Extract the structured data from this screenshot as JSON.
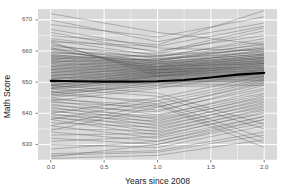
{
  "chart_data": {
    "type": "line",
    "title": "",
    "xlabel": "Years since 2008",
    "ylabel": "Math Score",
    "xlim": [
      -0.12,
      2.12
    ],
    "ylim": [
      625.0,
      673.5
    ],
    "xticks": [
      0.0,
      0.5,
      1.0,
      1.5,
      2.0
    ],
    "xticklabels": [
      "0.0",
      "0.5",
      "1.0",
      "1.5",
      "2.0"
    ],
    "yticks": [
      630,
      640,
      650,
      660,
      670
    ],
    "yticklabels": [
      "630",
      "640",
      "650",
      "660",
      "670"
    ],
    "grid": true,
    "grid_minor": true,
    "legend": "none",
    "panel_background": "#d9d9d9",
    "grid_color": "#ffffff",
    "series_color": "#4d4d4d",
    "trend_color": "#000000",
    "x": [
      0.0,
      1.0,
      2.0
    ],
    "trend_line": {
      "name": "Mean trend",
      "x": [
        0.0,
        0.25,
        0.5,
        0.75,
        1.0,
        1.25,
        1.5,
        1.75,
        2.0
      ],
      "values": [
        650.4,
        650.3,
        650.2,
        650.2,
        650.3,
        650.7,
        651.5,
        652.4,
        653.0
      ],
      "linewidth": 2.2
    },
    "series": [
      {
        "name": "s1",
        "values": [
          672.0,
          666.0,
          662.0
        ]
      },
      {
        "name": "s2",
        "values": [
          670.0,
          663.0,
          669.0
        ]
      },
      {
        "name": "s3",
        "values": [
          668.5,
          664.5,
          671.0
        ]
      },
      {
        "name": "s4",
        "values": [
          667.0,
          661.0,
          660.0
        ]
      },
      {
        "name": "s5",
        "values": [
          666.0,
          659.5,
          667.5
        ]
      },
      {
        "name": "s6",
        "values": [
          665.0,
          662.0,
          673.0
        ]
      },
      {
        "name": "s7",
        "values": [
          664.0,
          660.0,
          665.0
        ]
      },
      {
        "name": "s8",
        "values": [
          663.5,
          658.5,
          663.0
        ]
      },
      {
        "name": "s9",
        "values": [
          663.0,
          661.5,
          668.0
        ]
      },
      {
        "name": "s10",
        "values": [
          662.0,
          657.5,
          661.0
        ]
      },
      {
        "name": "s11",
        "values": [
          661.5,
          659.0,
          666.5
        ]
      },
      {
        "name": "s12",
        "values": [
          661.0,
          656.5,
          659.0
        ]
      },
      {
        "name": "s13",
        "values": [
          660.5,
          658.0,
          664.0
        ]
      },
      {
        "name": "s14",
        "values": [
          660.0,
          656.0,
          658.0
        ]
      },
      {
        "name": "s15",
        "values": [
          659.5,
          657.0,
          662.5
        ]
      },
      {
        "name": "s16",
        "values": [
          659.0,
          655.5,
          657.5
        ]
      },
      {
        "name": "s17",
        "values": [
          658.8,
          656.8,
          661.5
        ]
      },
      {
        "name": "s18",
        "values": [
          658.5,
          655.0,
          660.5
        ]
      },
      {
        "name": "s19",
        "values": [
          658.2,
          656.5,
          659.8
        ]
      },
      {
        "name": "s20",
        "values": [
          658.0,
          654.8,
          658.8
        ]
      },
      {
        "name": "s21",
        "values": [
          657.8,
          656.2,
          659.2
        ]
      },
      {
        "name": "s22",
        "values": [
          657.5,
          654.5,
          658.2
        ]
      },
      {
        "name": "s23",
        "values": [
          657.2,
          656.0,
          658.6
        ]
      },
      {
        "name": "s24",
        "values": [
          657.0,
          654.2,
          657.8
        ]
      },
      {
        "name": "s25",
        "values": [
          656.8,
          655.8,
          658.0
        ]
      },
      {
        "name": "s26",
        "values": [
          656.5,
          654.0,
          657.2
        ]
      },
      {
        "name": "s27",
        "values": [
          656.2,
          655.5,
          657.6
        ]
      },
      {
        "name": "s28",
        "values": [
          656.0,
          653.8,
          656.8
        ]
      },
      {
        "name": "s29",
        "values": [
          655.8,
          655.2,
          657.0
        ]
      },
      {
        "name": "s30",
        "values": [
          655.5,
          653.5,
          656.4
        ]
      },
      {
        "name": "s31",
        "values": [
          655.2,
          655.0,
          656.8
        ]
      },
      {
        "name": "s32",
        "values": [
          655.0,
          653.2,
          656.0
        ]
      },
      {
        "name": "s33",
        "values": [
          654.8,
          654.8,
          656.4
        ]
      },
      {
        "name": "s34",
        "values": [
          654.5,
          653.0,
          655.6
        ]
      },
      {
        "name": "s35",
        "values": [
          654.2,
          654.5,
          656.0
        ]
      },
      {
        "name": "s36",
        "values": [
          654.0,
          652.8,
          655.2
        ]
      },
      {
        "name": "s37",
        "values": [
          653.8,
          654.2,
          655.6
        ]
      },
      {
        "name": "s38",
        "values": [
          653.5,
          652.5,
          654.8
        ]
      },
      {
        "name": "s39",
        "values": [
          653.2,
          654.0,
          655.2
        ]
      },
      {
        "name": "s40",
        "values": [
          653.0,
          652.2,
          654.4
        ]
      },
      {
        "name": "s41",
        "values": [
          652.8,
          653.8,
          654.8
        ]
      },
      {
        "name": "s42",
        "values": [
          652.5,
          652.0,
          654.0
        ]
      },
      {
        "name": "s43",
        "values": [
          652.2,
          653.5,
          654.5
        ]
      },
      {
        "name": "s44",
        "values": [
          652.0,
          651.8,
          653.6
        ]
      },
      {
        "name": "s45",
        "values": [
          651.8,
          653.2,
          654.2
        ]
      },
      {
        "name": "s46",
        "values": [
          651.5,
          651.5,
          653.2
        ]
      },
      {
        "name": "s47",
        "values": [
          651.2,
          653.0,
          653.8
        ]
      },
      {
        "name": "s48",
        "values": [
          651.0,
          651.2,
          652.8
        ]
      },
      {
        "name": "s49",
        "values": [
          650.8,
          652.8,
          653.5
        ]
      },
      {
        "name": "s50",
        "values": [
          650.5,
          651.0,
          652.4
        ]
      },
      {
        "name": "s51",
        "values": [
          650.2,
          652.5,
          653.2
        ]
      },
      {
        "name": "s52",
        "values": [
          650.0,
          650.8,
          652.0
        ]
      },
      {
        "name": "s53",
        "values": [
          649.8,
          652.2,
          652.8
        ]
      },
      {
        "name": "s54",
        "values": [
          649.5,
          650.5,
          651.6
        ]
      },
      {
        "name": "s55",
        "values": [
          649.2,
          652.0,
          652.5
        ]
      },
      {
        "name": "s56",
        "values": [
          649.0,
          650.2,
          651.2
        ]
      },
      {
        "name": "s57",
        "values": [
          648.8,
          651.8,
          652.2
        ]
      },
      {
        "name": "s58",
        "values": [
          648.5,
          650.0,
          650.8
        ]
      },
      {
        "name": "s59",
        "values": [
          648.2,
          651.5,
          651.8
        ]
      },
      {
        "name": "s60",
        "values": [
          648.0,
          649.8,
          650.4
        ]
      },
      {
        "name": "s61",
        "values": [
          647.5,
          651.0,
          651.5
        ]
      },
      {
        "name": "s62",
        "values": [
          647.0,
          649.5,
          650.0
        ]
      },
      {
        "name": "s63",
        "values": [
          646.5,
          650.5,
          651.0
        ]
      },
      {
        "name": "s64",
        "values": [
          646.0,
          649.0,
          649.5
        ]
      },
      {
        "name": "s65",
        "values": [
          645.5,
          650.0,
          650.5
        ]
      },
      {
        "name": "s66",
        "values": [
          645.0,
          648.5,
          649.0
        ]
      },
      {
        "name": "s67",
        "values": [
          656.5,
          657.5,
          659.5
        ]
      },
      {
        "name": "s68",
        "values": [
          657.5,
          658.5,
          660.5
        ]
      },
      {
        "name": "s69",
        "values": [
          658.5,
          657.0,
          661.0
        ]
      },
      {
        "name": "s70",
        "values": [
          659.5,
          658.2,
          662.0
        ]
      },
      {
        "name": "s71",
        "values": [
          655.0,
          657.2,
          660.0
        ]
      },
      {
        "name": "s72",
        "values": [
          654.0,
          656.5,
          659.0
        ]
      },
      {
        "name": "s73",
        "values": [
          653.0,
          655.8,
          658.5
        ]
      },
      {
        "name": "s74",
        "values": [
          652.0,
          655.0,
          657.5
        ]
      },
      {
        "name": "s75",
        "values": [
          651.0,
          654.2,
          657.0
        ]
      },
      {
        "name": "s76",
        "values": [
          650.0,
          653.5,
          656.5
        ]
      },
      {
        "name": "s77",
        "values": [
          649.0,
          652.8,
          656.0
        ]
      },
      {
        "name": "s78",
        "values": [
          648.0,
          652.0,
          655.5
        ]
      },
      {
        "name": "s79",
        "values": [
          660.5,
          655.0,
          656.0
        ]
      },
      {
        "name": "s80",
        "values": [
          661.0,
          654.0,
          655.0
        ]
      },
      {
        "name": "s81",
        "values": [
          662.5,
          653.0,
          654.5
        ]
      },
      {
        "name": "s82",
        "values": [
          663.0,
          652.0,
          654.0
        ]
      },
      {
        "name": "s83",
        "values": [
          645.0,
          641.0,
          648.0
        ]
      },
      {
        "name": "s84",
        "values": [
          644.0,
          639.5,
          646.5
        ]
      },
      {
        "name": "s85",
        "values": [
          643.5,
          642.0,
          650.0
        ]
      },
      {
        "name": "s86",
        "values": [
          643.0,
          638.0,
          645.0
        ]
      },
      {
        "name": "s87",
        "values": [
          642.5,
          640.5,
          649.0
        ]
      },
      {
        "name": "s88",
        "values": [
          642.0,
          637.0,
          644.0
        ]
      },
      {
        "name": "s89",
        "values": [
          641.5,
          639.0,
          647.5
        ]
      },
      {
        "name": "s90",
        "values": [
          641.0,
          636.0,
          643.0
        ]
      },
      {
        "name": "s91",
        "values": [
          640.5,
          638.5,
          646.0
        ]
      },
      {
        "name": "s92",
        "values": [
          640.0,
          635.0,
          642.0
        ]
      },
      {
        "name": "s93",
        "values": [
          639.5,
          637.5,
          645.5
        ]
      },
      {
        "name": "s94",
        "values": [
          639.0,
          634.0,
          641.0
        ]
      },
      {
        "name": "s95",
        "values": [
          638.5,
          636.5,
          644.5
        ]
      },
      {
        "name": "s96",
        "values": [
          638.0,
          633.0,
          640.0
        ]
      },
      {
        "name": "s97",
        "values": [
          637.0,
          635.5,
          643.5
        ]
      },
      {
        "name": "s98",
        "values": [
          636.0,
          632.0,
          639.0
        ]
      },
      {
        "name": "s99",
        "values": [
          635.0,
          634.5,
          642.5
        ]
      },
      {
        "name": "s100",
        "values": [
          634.0,
          631.0,
          638.0
        ]
      },
      {
        "name": "s101",
        "values": [
          633.0,
          633.5,
          641.5
        ]
      },
      {
        "name": "s102",
        "values": [
          632.0,
          630.0,
          637.0
        ]
      },
      {
        "name": "s103",
        "values": [
          631.0,
          632.5,
          640.5
        ]
      },
      {
        "name": "s104",
        "values": [
          630.0,
          629.0,
          636.0
        ]
      },
      {
        "name": "s105",
        "values": [
          628.5,
          631.0,
          639.0
        ]
      },
      {
        "name": "s106",
        "values": [
          627.0,
          628.0,
          634.0
        ]
      },
      {
        "name": "s107",
        "values": [
          626.0,
          630.0,
          638.0
        ]
      },
      {
        "name": "s108",
        "values": [
          646.0,
          644.0,
          632.0
        ]
      },
      {
        "name": "s109",
        "values": [
          647.0,
          643.0,
          630.5
        ]
      },
      {
        "name": "s110",
        "values": [
          644.5,
          642.5,
          629.0
        ]
      },
      {
        "name": "s111",
        "values": [
          648.0,
          645.5,
          635.0
        ]
      },
      {
        "name": "s112",
        "values": [
          649.0,
          646.5,
          636.5
        ]
      },
      {
        "name": "s113",
        "values": [
          626.5,
          627.5,
          633.0
        ]
      },
      {
        "name": "s114",
        "values": [
          625.5,
          626.5,
          631.5
        ]
      },
      {
        "name": "s115",
        "values": [
          640.0,
          645.0,
          652.0
        ]
      },
      {
        "name": "s116",
        "values": [
          638.0,
          644.0,
          651.0
        ]
      },
      {
        "name": "s117",
        "values": [
          636.0,
          643.0,
          650.5
        ]
      },
      {
        "name": "s118",
        "values": [
          634.5,
          642.0,
          649.5
        ]
      },
      {
        "name": "s119",
        "values": [
          644.0,
          648.0,
          653.0
        ]
      },
      {
        "name": "s120",
        "values": [
          646.5,
          649.0,
          654.0
        ]
      }
    ]
  }
}
